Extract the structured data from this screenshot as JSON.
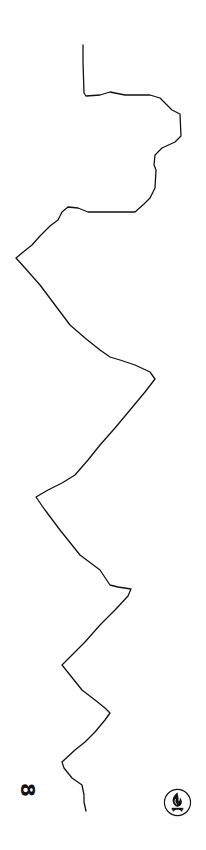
{
  "page": {
    "background": "#ffffff",
    "line_color": "#111111",
    "page_number": "8",
    "emblem": "flame-emblem-icon"
  },
  "map": {
    "type": "boundary-outline",
    "stroke_width": 1.3,
    "boundary_path": [
      [
        83,
        45
      ],
      [
        83,
        62
      ],
      [
        84,
        93
      ],
      [
        86,
        96
      ],
      [
        100,
        95
      ],
      [
        110,
        92
      ],
      [
        125,
        95
      ],
      [
        150,
        95
      ],
      [
        160,
        98
      ],
      [
        167,
        105
      ],
      [
        172,
        110
      ],
      [
        180,
        114
      ],
      [
        181,
        136
      ],
      [
        175,
        142
      ],
      [
        162,
        148
      ],
      [
        155,
        155
      ],
      [
        154,
        165
      ],
      [
        156,
        170
      ],
      [
        155,
        188
      ],
      [
        150,
        198
      ],
      [
        144,
        204
      ],
      [
        135,
        212
      ],
      [
        125,
        212
      ],
      [
        88,
        212
      ],
      [
        78,
        208
      ],
      [
        68,
        207
      ],
      [
        62,
        212
      ],
      [
        58,
        220
      ],
      [
        50,
        226
      ],
      [
        40,
        236
      ],
      [
        32,
        245
      ],
      [
        22,
        253
      ],
      [
        16,
        258
      ],
      [
        25,
        268
      ],
      [
        40,
        285
      ],
      [
        55,
        305
      ],
      [
        70,
        325
      ],
      [
        85,
        338
      ],
      [
        100,
        350
      ],
      [
        110,
        357
      ],
      [
        120,
        360
      ],
      [
        135,
        365
      ],
      [
        150,
        372
      ],
      [
        155,
        379
      ],
      [
        145,
        392
      ],
      [
        130,
        410
      ],
      [
        115,
        428
      ],
      [
        100,
        445
      ],
      [
        88,
        460
      ],
      [
        75,
        475
      ],
      [
        62,
        483
      ],
      [
        48,
        490
      ],
      [
        36,
        497
      ],
      [
        45,
        510
      ],
      [
        60,
        530
      ],
      [
        80,
        555
      ],
      [
        100,
        570
      ],
      [
        110,
        585
      ],
      [
        118,
        587
      ],
      [
        131,
        589
      ],
      [
        128,
        596
      ],
      [
        115,
        610
      ],
      [
        100,
        625
      ],
      [
        85,
        642
      ],
      [
        72,
        655
      ],
      [
        62,
        665
      ],
      [
        70,
        675
      ],
      [
        82,
        690
      ],
      [
        95,
        700
      ],
      [
        105,
        708
      ],
      [
        110,
        713
      ],
      [
        105,
        720
      ],
      [
        95,
        732
      ],
      [
        85,
        742
      ],
      [
        75,
        750
      ],
      [
        62,
        762
      ],
      [
        64,
        768
      ],
      [
        72,
        778
      ],
      [
        82,
        785
      ],
      [
        84,
        795
      ],
      [
        84,
        802
      ],
      [
        86,
        811
      ]
    ]
  }
}
